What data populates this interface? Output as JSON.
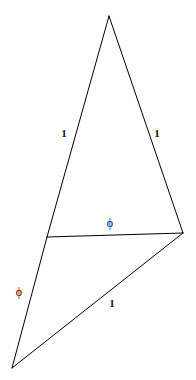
{
  "figure": {
    "background_color": "#ffffff",
    "stroke_color": "#000000",
    "stroke_width": 1,
    "width": 196,
    "height": 380,
    "vertices": {
      "apex": {
        "name": "apex",
        "x": 109,
        "y": 16
      },
      "mid_left": {
        "name": "mid-left",
        "x": 47,
        "y": 237
      },
      "right": {
        "name": "right",
        "x": 183,
        "y": 233
      },
      "bottom_left": {
        "name": "bottom-left",
        "x": 12,
        "y": 368
      }
    },
    "edges": [
      {
        "name": "apex-to-mid-left",
        "from": "apex",
        "to": "mid_left",
        "label": "1"
      },
      {
        "name": "apex-to-right",
        "from": "apex",
        "to": "right",
        "label": "1"
      },
      {
        "name": "mid-left-to-right",
        "from": "mid_left",
        "to": "right",
        "label": "phi"
      },
      {
        "name": "mid-left-to-bottom-left",
        "from": "mid_left",
        "to": "bottom_left",
        "label": "phi"
      },
      {
        "name": "bottom-left-to-right",
        "from": "bottom_left",
        "to": "right",
        "label": "1"
      }
    ],
    "labels": [
      {
        "name": "label-left-side-one",
        "text": "1",
        "x": 64,
        "y": 133,
        "kind": "one"
      },
      {
        "name": "label-right-side-one",
        "text": "1",
        "x": 157,
        "y": 133,
        "kind": "one"
      },
      {
        "name": "label-base-phi",
        "text": "ϕ",
        "x": 110,
        "y": 223,
        "kind": "phi"
      },
      {
        "name": "label-lower-left-phi",
        "text": "ϕ",
        "x": 19,
        "y": 292,
        "kind": "phi"
      },
      {
        "name": "label-bottom-one",
        "text": "1",
        "x": 112,
        "y": 303,
        "kind": "one"
      }
    ]
  }
}
